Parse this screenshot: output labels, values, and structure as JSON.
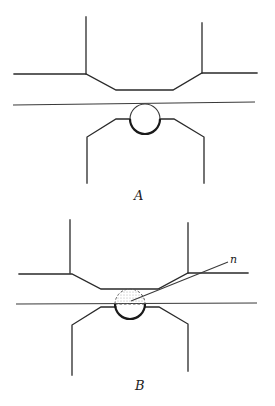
{
  "figure": {
    "panels": [
      {
        "id": "A",
        "label": "A",
        "description": "Sphere held between upper and lower stepped surfaces, touching a horizontal plane"
      },
      {
        "id": "B",
        "label": "B",
        "description": "Sphere partially above the plane; upper cap shown dashed and stippled",
        "annotation": "n"
      }
    ],
    "colors": {
      "line": "#2a2a2a",
      "background": "#ffffff",
      "stipple": "#bbbbbb"
    }
  }
}
